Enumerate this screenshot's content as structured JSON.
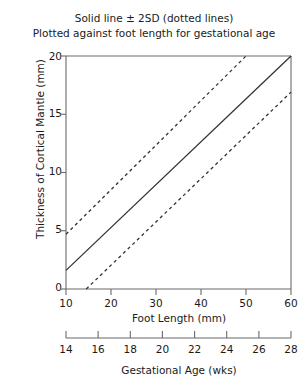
{
  "chart_data": {
    "type": "line",
    "title": "Solid line ± 2SD (dotted lines)",
    "subtitle": "Plotted against foot length for gestational age",
    "xlabel": "Foot Length (mm)",
    "ylabel": "Thickness of Cortical Mantle (mm)",
    "secondary_xlabel": "Gestational Age (wks)",
    "xlim": [
      10,
      60
    ],
    "ylim": [
      0,
      20
    ],
    "secondary_xlim": [
      14,
      28
    ],
    "xticks": [
      10,
      20,
      30,
      40,
      50,
      60
    ],
    "xtick_labels": [
      "10",
      "20",
      "30",
      "40",
      "50",
      "60"
    ],
    "yticks": [
      0,
      5,
      10,
      15,
      20
    ],
    "ytick_labels": [
      "0",
      "5",
      "10",
      "15",
      "20"
    ],
    "secondary_xticks": [
      14,
      16,
      18,
      20,
      22,
      24,
      26,
      28
    ],
    "secondary_xtick_labels": [
      "14",
      "16",
      "18",
      "20",
      "22",
      "24",
      "26",
      "28"
    ],
    "grid": false,
    "legend_position": "none",
    "series": [
      {
        "name": "Mean (solid line)",
        "style": "solid",
        "color": "#333333",
        "x": [
          10,
          60
        ],
        "values": [
          1.6,
          20.0
        ]
      },
      {
        "name": "+2SD (dotted line)",
        "style": "dashed",
        "color": "#333333",
        "x": [
          10,
          50
        ],
        "values": [
          4.7,
          20.0
        ]
      },
      {
        "name": "-2SD (dotted line)",
        "style": "dashed",
        "color": "#333333",
        "x": [
          14.5,
          60
        ],
        "values": [
          0.0,
          16.9
        ]
      }
    ],
    "annotations": []
  },
  "colors": {
    "axis": "#6b6b6b",
    "line": "#333333",
    "text": "#1a1a1a",
    "background": "#ffffff"
  }
}
